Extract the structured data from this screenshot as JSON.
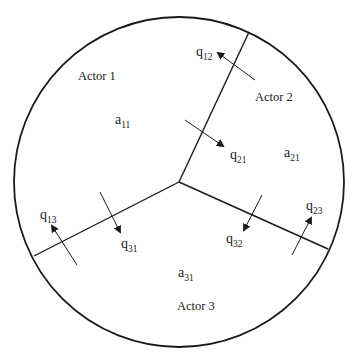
{
  "diagram": {
    "type": "circle-partitioned-into-three-regions",
    "colors": {
      "stroke": "#1a1a1a",
      "background": "#ffffff"
    },
    "circle": {
      "cx": 179,
      "cy": 182,
      "r": 165
    },
    "center": {
      "x": 179,
      "y": 182
    },
    "boundaries": [
      {
        "id": "boundary-1-2",
        "to": {
          "x": 249,
          "y": 32
        }
      },
      {
        "id": "boundary-1-3",
        "to": {
          "x": 34,
          "y": 256
        }
      },
      {
        "id": "boundary-2-3",
        "to": {
          "x": 328,
          "y": 249
        }
      }
    ],
    "regions": [
      {
        "actor": "Actor 1",
        "actor_pos": {
          "x": 78,
          "y": 80
        },
        "param": "a",
        "param_sub": "11",
        "param_pos": {
          "x": 115,
          "y": 124
        }
      },
      {
        "actor": "Actor 2",
        "actor_pos": {
          "x": 255,
          "y": 101
        },
        "param": "a",
        "param_sub": "21",
        "param_pos": {
          "x": 284,
          "y": 157
        }
      },
      {
        "actor": "Actor 3",
        "actor_pos": {
          "x": 177,
          "y": 310
        },
        "param": "a",
        "param_sub": "31",
        "param_pos": {
          "x": 178,
          "y": 277
        }
      }
    ],
    "flows": [
      {
        "label": "q",
        "sub": "12",
        "from": {
          "x": 255,
          "y": 80
        },
        "to": {
          "x": 218,
          "y": 53
        },
        "label_pos": {
          "x": 196,
          "y": 56
        }
      },
      {
        "label": "q",
        "sub": "21",
        "from": {
          "x": 185,
          "y": 120
        },
        "to": {
          "x": 223,
          "y": 146
        },
        "label_pos": {
          "x": 230,
          "y": 159
        }
      },
      {
        "label": "q",
        "sub": "13",
        "from": {
          "x": 77,
          "y": 265
        },
        "to": {
          "x": 52,
          "y": 226
        },
        "label_pos": {
          "x": 40,
          "y": 219
        }
      },
      {
        "label": "q",
        "sub": "31",
        "from": {
          "x": 100,
          "y": 192
        },
        "to": {
          "x": 120,
          "y": 232
        },
        "label_pos": {
          "x": 121,
          "y": 248
        }
      },
      {
        "label": "q",
        "sub": "32",
        "from": {
          "x": 262,
          "y": 195
        },
        "to": {
          "x": 244,
          "y": 230
        },
        "label_pos": {
          "x": 226,
          "y": 243
        }
      },
      {
        "label": "q",
        "sub": "23",
        "from": {
          "x": 292,
          "y": 255
        },
        "to": {
          "x": 311,
          "y": 218
        },
        "label_pos": {
          "x": 306,
          "y": 210
        }
      }
    ]
  }
}
